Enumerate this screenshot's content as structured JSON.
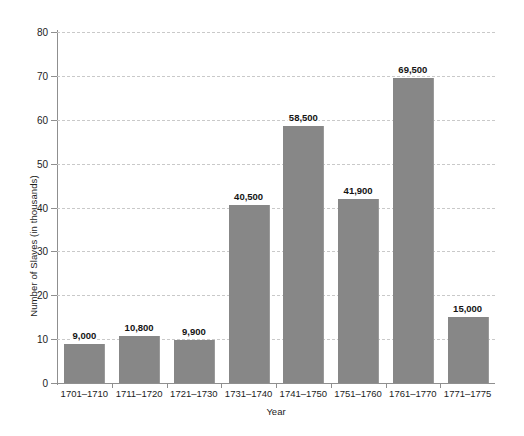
{
  "chart_data": {
    "type": "bar",
    "title": "",
    "xlabel": "Year",
    "ylabel": "Number of Slaves (in thousands)",
    "categories": [
      "1701–1710",
      "1711–1720",
      "1721–1730",
      "1731–1740",
      "1741–1750",
      "1751–1760",
      "1761–1770",
      "1771–1775"
    ],
    "values": [
      9,
      10.8,
      9.9,
      40.5,
      58.5,
      41.9,
      69.5,
      15
    ],
    "data_labels": [
      "9,000",
      "10,800",
      "9,900",
      "40,500",
      "58,500",
      "41,900",
      "69,500",
      "15,000"
    ],
    "ylim": [
      0,
      80
    ],
    "ytick_labels": [
      "0",
      "10",
      "20",
      "30",
      "40",
      "50",
      "60",
      "70",
      "80"
    ],
    "ytick_values": [
      0,
      10,
      20,
      30,
      40,
      50,
      60,
      70,
      80
    ],
    "grid": "horizontal-dashed",
    "legend": "none",
    "bar_color": "#878787",
    "grid_color": "#c9c9c9",
    "axis_color": "#8f8f8f",
    "text_color": "#1c1c1c"
  }
}
